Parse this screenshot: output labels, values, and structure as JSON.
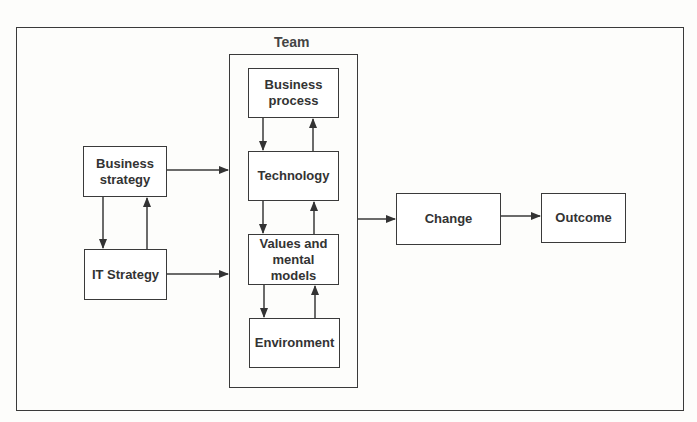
{
  "diagram": {
    "container_label": "Team",
    "nodes": {
      "business_strategy": "Business strategy",
      "it_strategy": "IT Strategy",
      "business_process": "Business process",
      "technology": "Technology",
      "values_mental_models": "Values and mental models",
      "environment": "Environment",
      "change": "Change",
      "outcome": "Outcome"
    },
    "edges": [
      {
        "from": "Business strategy",
        "to": "IT Strategy"
      },
      {
        "from": "IT Strategy",
        "to": "Business strategy"
      },
      {
        "from": "Business strategy",
        "to": "Team"
      },
      {
        "from": "IT Strategy",
        "to": "Team"
      },
      {
        "from": "Business process",
        "to": "Technology"
      },
      {
        "from": "Technology",
        "to": "Business process"
      },
      {
        "from": "Technology",
        "to": "Values and mental models"
      },
      {
        "from": "Values and mental models",
        "to": "Technology"
      },
      {
        "from": "Values and mental models",
        "to": "Environment"
      },
      {
        "from": "Environment",
        "to": "Values and mental models"
      },
      {
        "from": "Team",
        "to": "Change"
      },
      {
        "from": "Change",
        "to": "Outcome"
      }
    ]
  }
}
